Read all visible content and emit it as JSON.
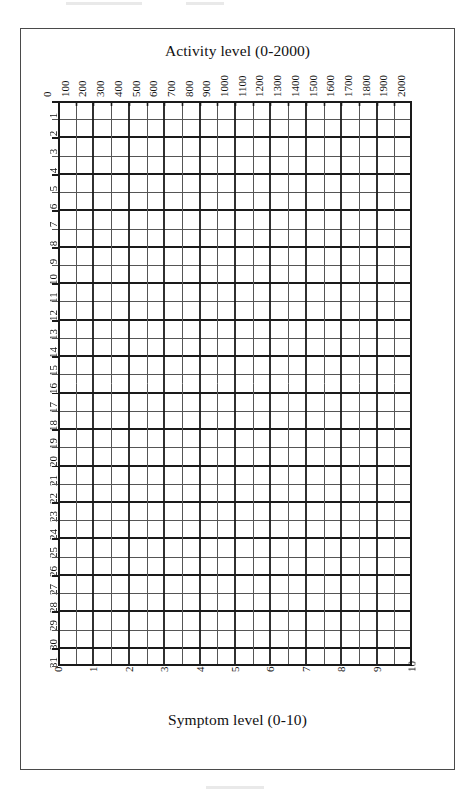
{
  "document": {
    "kind": "blank-symptom-activity-diary-grid",
    "top_title": "Activity level (0-2000)",
    "bottom_title": "Symptom level (0-10)"
  },
  "chart_data": {
    "type": "table",
    "title": "Activity level (0-2000)",
    "subtitle": "",
    "xlabel": "Activity level (0-2000)",
    "xlabel_secondary": "Symptom level (0-10)",
    "ylabel": "",
    "grid": true,
    "legend_position": "none",
    "annotations": [],
    "series": [],
    "values": [],
    "note": "Empty printed grid: no data plotted. 20 activity columns x 31 day rows.",
    "x_top_axis": {
      "label": "Activity level (0-2000)",
      "min": 0,
      "max": 2000,
      "step": 100,
      "position": "top",
      "tick_labels": [
        "0",
        "100",
        "200",
        "300",
        "400",
        "500",
        "600",
        "700",
        "800",
        "900",
        "1000",
        "1100",
        "1200",
        "1300",
        "1400",
        "1500",
        "1600",
        "1700",
        "1800",
        "1900",
        "2000"
      ]
    },
    "x_bottom_axis": {
      "label": "Symptom level (0-10)",
      "min": 0,
      "max": 10,
      "step": 1,
      "position": "bottom",
      "tick_labels": [
        "0",
        "1",
        "2",
        "3",
        "4",
        "5",
        "6",
        "7",
        "8",
        "9",
        "10"
      ]
    },
    "y_axis": {
      "label": "",
      "min": 1,
      "max": 31,
      "step": 1,
      "position": "left",
      "tick_labels": [
        "1",
        "2",
        "3",
        "4",
        "5",
        "6",
        "7",
        "8",
        "9",
        "10",
        "11",
        "12",
        "13",
        "14",
        "15",
        "16",
        "17",
        "18",
        "19",
        "20",
        "21",
        "22",
        "23",
        "24",
        "25",
        "26",
        "27",
        "28",
        "29",
        "30",
        "31"
      ]
    },
    "columns": 20,
    "rows": 31
  },
  "style": {
    "ink": "#1a1a1a",
    "thin_line": "#555555",
    "thick_line": "#1a1a1a",
    "border": "#4a4a4a",
    "paper": "#ffffff"
  }
}
